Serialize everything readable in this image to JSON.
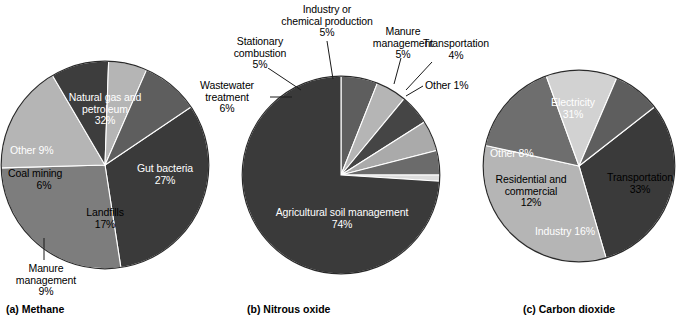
{
  "figure": {
    "background": "#ffffff",
    "palette": {
      "darkest": "#333333",
      "dark": "#3a3a3a",
      "mid_dark": "#4a4a4a",
      "mid": "#5e5e5e",
      "mid_light": "#7d7d7d",
      "light": "#b5b5b5",
      "lightest": "#d2d2d2",
      "outline": "#1a1a1a",
      "label_on_dark": "#ffffff",
      "label_on_light": "#000000"
    },
    "captions": [
      {
        "id": "methane",
        "text": "(a) Methane"
      },
      {
        "id": "nitrous_oxide",
        "text": "(b) Nitrous oxide"
      },
      {
        "id": "carbon_dioxide",
        "text": "(c) Carbon dioxide"
      }
    ]
  },
  "chart_data": [
    {
      "type": "pie",
      "id": "methane",
      "title": "(a) Methane",
      "unit": "%",
      "start_angle_deg": -34,
      "direction": "clockwise",
      "categories": [
        "Natural gas and petroleum",
        "Gut bacteria",
        "Landfills",
        "Manure management",
        "Coal mining",
        "Other"
      ],
      "values": [
        32,
        27,
        17,
        9,
        6,
        9
      ],
      "slices": [
        {
          "label": "Natural gas and petroleum",
          "value": 32,
          "value_text": "32%",
          "color": "#3a3a3a",
          "label_placement": "inside",
          "label_color": "#ffffff"
        },
        {
          "label": "Gut bacteria",
          "value": 27,
          "value_text": "27%",
          "color": "#7d7d7d",
          "label_placement": "inside",
          "label_color": "#ffffff"
        },
        {
          "label": "Landfills",
          "value": 17,
          "value_text": "17%",
          "color": "#b5b5b5",
          "label_placement": "inside",
          "label_color": "#000000"
        },
        {
          "label": "Manure management",
          "value": 9,
          "value_text": "9%",
          "color": "#3d3d3d",
          "label_placement": "outside",
          "label_color": "#000000"
        },
        {
          "label": "Coal mining",
          "value": 6,
          "value_text": "6%",
          "color": "#b5b5b5",
          "label_placement": "inside",
          "label_color": "#000000"
        },
        {
          "label": "Other",
          "value": 9,
          "value_text": "9%",
          "color": "#5e5e5e",
          "label_placement": "inside",
          "label_color": "#ffffff"
        }
      ],
      "labels_text": [
        "Natural gas and petroleum 32%",
        "Gut bacteria 27%",
        "Landfills 17%",
        "Manure management 9%",
        "Coal mining 6%",
        "Other 9%"
      ]
    },
    {
      "type": "pie",
      "id": "nitrous_oxide",
      "title": "(b) Nitrous oxide",
      "unit": "%",
      "start_angle_deg": -90,
      "direction": "clockwise",
      "categories": [
        "Wastewater treatment",
        "Stationary combustion",
        "Industry or chemical production",
        "Manure management",
        "Transportation",
        "Other",
        "Agricultural soil management"
      ],
      "values": [
        6,
        5,
        5,
        5,
        4,
        1,
        74
      ],
      "slices": [
        {
          "label": "Wastewater treatment",
          "value": 6,
          "value_text": "6%",
          "color": "#5e5e5e",
          "label_placement": "outside",
          "label_color": "#000000"
        },
        {
          "label": "Stationary combustion",
          "value": 5,
          "value_text": "5%",
          "color": "#b5b5b5",
          "label_placement": "outside",
          "label_color": "#000000"
        },
        {
          "label": "Industry or chemical production",
          "value": 5,
          "value_text": "5%",
          "color": "#454545",
          "label_placement": "outside",
          "label_color": "#000000"
        },
        {
          "label": "Manure management",
          "value": 5,
          "value_text": "5%",
          "color": "#aaaaaa",
          "label_placement": "outside",
          "label_color": "#000000"
        },
        {
          "label": "Transportation",
          "value": 4,
          "value_text": "4%",
          "color": "#6b6b6b",
          "label_placement": "outside",
          "label_color": "#000000"
        },
        {
          "label": "Other",
          "value": 1,
          "value_text": "1%",
          "color": "#dcdcdc",
          "label_placement": "outside",
          "label_color": "#000000"
        },
        {
          "label": "Agricultural soil management",
          "value": 74,
          "value_text": "74%",
          "color": "#3a3a3a",
          "label_placement": "inside",
          "label_color": "#ffffff"
        }
      ],
      "labels_text": [
        "Wastewater treatment 6%",
        "Stationary combustion 5%",
        "Industry or chemical production 5%",
        "Manure management 5%",
        "Transportation 4%",
        "Other 1%",
        "Agricultural soil management 74%"
      ]
    },
    {
      "type": "pie",
      "id": "carbon_dioxide",
      "title": "(c) Carbon dioxide",
      "unit": "%",
      "start_angle_deg": -38,
      "direction": "clockwise",
      "categories": [
        "Electricity",
        "Transportation",
        "Industry",
        "Residential and commercial",
        "Other"
      ],
      "values": [
        31,
        33,
        16,
        12,
        8
      ],
      "slices": [
        {
          "label": "Electricity",
          "value": 31,
          "value_text": "31%",
          "color": "#3a3a3a",
          "label_placement": "inside",
          "label_color": "#ffffff"
        },
        {
          "label": "Transportation",
          "value": 33,
          "value_text": "33%",
          "color": "#b5b5b5",
          "label_placement": "inside",
          "label_color": "#000000"
        },
        {
          "label": "Industry",
          "value": 16,
          "value_text": "16%",
          "color": "#6e6e6e",
          "label_placement": "inside",
          "label_color": "#ffffff"
        },
        {
          "label": "Residential and commercial",
          "value": 12,
          "value_text": "12%",
          "color": "#d2d2d2",
          "label_placement": "inside",
          "label_color": "#000000"
        },
        {
          "label": "Other",
          "value": 8,
          "value_text": "8%",
          "color": "#5e5e5e",
          "label_placement": "inside",
          "label_color": "#ffffff"
        }
      ],
      "labels_text": [
        "Electricity 31%",
        "Transportation 33%",
        "Industry 16%",
        "Residential and commercial 12%",
        "Other 8%"
      ]
    }
  ],
  "methane_labels": {
    "natural_gas_l1": "Natural gas and",
    "natural_gas_l2": "petroleum",
    "natural_gas_pct": "32%",
    "gut_bacteria_l1": "Gut bacteria",
    "gut_bacteria_pct": "27%",
    "landfills_l1": "Landfills",
    "landfills_pct": "17%",
    "other_l1": "Other 9%",
    "coal_mining_l1": "Coal mining",
    "coal_mining_pct": "6%",
    "manure_l1": "Manure",
    "manure_l2": "management",
    "manure_pct": "9%"
  },
  "nitrous_labels": {
    "industry_l1": "Industry or",
    "industry_l2": "chemical production",
    "industry_pct": "5%",
    "stationary_l1": "Stationary",
    "stationary_l2": "combustion",
    "stationary_pct": "5%",
    "wastewater_l1": "Wastewater",
    "wastewater_l2": "treatment",
    "wastewater_pct": "6%",
    "manure_l1": "Manure",
    "manure_l2": "management",
    "manure_pct": "5%",
    "transportation_l1": "Transportation",
    "transportation_pct": "4%",
    "other_l1": "Other 1%",
    "agricultural_l1": "Agricultural soil management",
    "agricultural_pct": "74%"
  },
  "carbon_labels": {
    "electricity_l1": "Electricity",
    "electricity_pct": "31%",
    "transportation_l1": "Transportation",
    "transportation_pct": "33%",
    "industry_l1": "Industry 16%",
    "residential_l1": "Residential and",
    "residential_l2": "commercial",
    "residential_pct": "12%",
    "other_l1": "Other 8%"
  }
}
